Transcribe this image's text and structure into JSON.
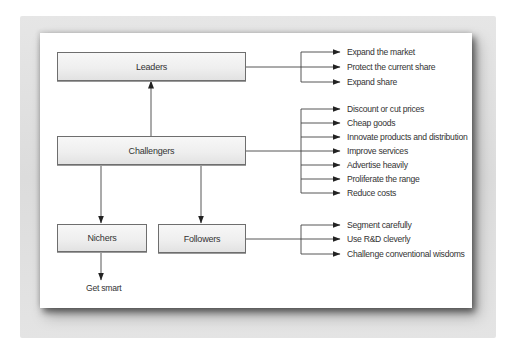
{
  "diagram": {
    "type": "flowchart",
    "nodes": {
      "leaders": {
        "label": "Leaders"
      },
      "challengers": {
        "label": "Challengers"
      },
      "nichers": {
        "label": "Nichers"
      },
      "followers": {
        "label": "Followers"
      }
    },
    "edges": [
      {
        "from": "challengers",
        "to": "leaders"
      },
      {
        "from": "challengers",
        "to": "nichers"
      },
      {
        "from": "challengers",
        "to": "followers"
      }
    ],
    "leaders_strategies": [
      "Expand the market",
      "Protect the current share",
      "Expand share"
    ],
    "challengers_strategies": [
      "Discount or cut prices",
      "Cheap goods",
      "Innovate products and distribution",
      "Improve services",
      "Advertise heavily",
      "Proliferate the range",
      "Reduce costs"
    ],
    "followers_strategies": [
      "Segment carefully",
      "Use R&D cleverly",
      "Challenge conventional wisdoms"
    ],
    "nichers_strategy": "Get smart"
  },
  "colors": {
    "line": "#444444",
    "box_border": "#6e6e6e",
    "text": "#333333",
    "frame": "#dcdcdc"
  }
}
